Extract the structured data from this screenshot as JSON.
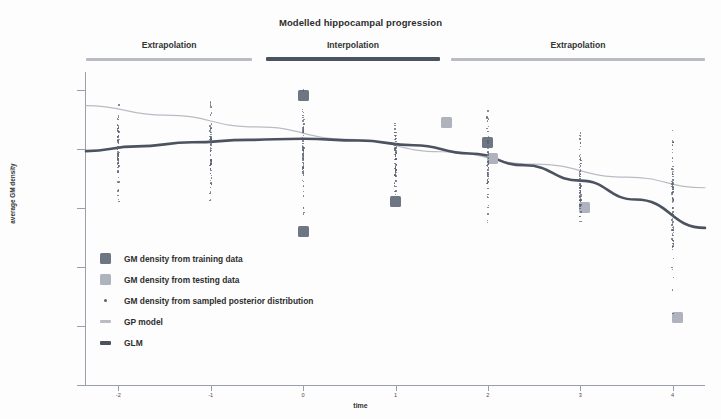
{
  "chart_data": {
    "type": "scatter",
    "title": "Modelled hippocampal progression",
    "xlabel": "time",
    "ylabel": "average GM density",
    "xlim": [
      -2.35,
      4.35
    ],
    "ylim": [
      0.95,
      0.9765
    ],
    "grid": false,
    "legend_position": "inner-lower-left",
    "x_ticks": [
      "-2",
      "-1",
      "0",
      "1",
      "2",
      "3",
      "4"
    ],
    "x_tick_values": [
      -2,
      -1,
      0,
      1,
      2,
      3,
      4
    ],
    "y_ticks": [
      "0.975",
      "0.97",
      "0.965",
      "0.96",
      "0.955",
      "0.95"
    ],
    "y_tick_values": [
      0.975,
      0.97,
      0.965,
      0.96,
      0.955,
      0.95
    ],
    "phase_bands": [
      {
        "label": "Extrapolation",
        "style": "light",
        "x_start": -2.35,
        "x_end": -0.55
      },
      {
        "label": "Interpolation",
        "style": "dark",
        "x_start": -0.4,
        "x_end": 1.48
      },
      {
        "label": "Extrapolation",
        "style": "light",
        "x_start": 1.6,
        "x_end": 4.35
      }
    ],
    "series": [
      {
        "name": "GM density from training data",
        "type": "scatter",
        "marker": "square",
        "color": "#6f7683",
        "points": [
          {
            "x": 0.0,
            "y": 0.9745
          },
          {
            "x": 0.0,
            "y": 0.963
          },
          {
            "x": 1.0,
            "y": 0.9655
          },
          {
            "x": 2.0,
            "y": 0.9705
          }
        ]
      },
      {
        "name": "GM density from testing data",
        "type": "scatter",
        "marker": "square",
        "color": "#aeb3bd",
        "points": [
          {
            "x": 1.55,
            "y": 0.9722
          },
          {
            "x": 2.05,
            "y": 0.9692
          },
          {
            "x": 3.05,
            "y": 0.965
          },
          {
            "x": 4.05,
            "y": 0.9557
          }
        ]
      },
      {
        "name": "GM density from sampled posterior distribution",
        "type": "scatter",
        "marker": "dot",
        "color": "#5a6070",
        "columns": [
          {
            "x": -2.0,
            "y_center": 0.97,
            "y_low": 0.9623,
            "y_high": 0.9748,
            "n": 46
          },
          {
            "x": -1.0,
            "y_center": 0.97,
            "y_low": 0.9636,
            "y_high": 0.9745,
            "n": 44
          },
          {
            "x": 0.0,
            "y_center": 0.9699,
            "y_low": 0.9628,
            "y_high": 0.9752,
            "n": 48
          },
          {
            "x": 1.0,
            "y_center": 0.9695,
            "y_low": 0.9634,
            "y_high": 0.9747,
            "n": 46
          },
          {
            "x": 2.0,
            "y_center": 0.9688,
            "y_low": 0.963,
            "y_high": 0.9744,
            "n": 46
          },
          {
            "x": 3.0,
            "y_center": 0.9672,
            "y_low": 0.9606,
            "y_high": 0.9736,
            "n": 48
          },
          {
            "x": 4.0,
            "y_center": 0.9652,
            "y_low": 0.9556,
            "y_high": 0.9742,
            "n": 54
          }
        ]
      },
      {
        "name": "GP model",
        "type": "line",
        "color": "#b9bcc4",
        "linewidth": 1.2,
        "points": [
          {
            "x": -2.35,
            "y": 0.97365
          },
          {
            "x": -1.5,
            "y": 0.97285
          },
          {
            "x": -0.5,
            "y": 0.97185
          },
          {
            "x": 0.5,
            "y": 0.9708
          },
          {
            "x": 1.5,
            "y": 0.96975
          },
          {
            "x": 2.5,
            "y": 0.9687
          },
          {
            "x": 3.5,
            "y": 0.9676
          },
          {
            "x": 4.35,
            "y": 0.9667
          }
        ]
      },
      {
        "name": "GLM",
        "type": "line",
        "color": "#4c5360",
        "linewidth": 2.6,
        "points": [
          {
            "x": -2.35,
            "y": 0.9698
          },
          {
            "x": -1.8,
            "y": 0.9702
          },
          {
            "x": -1.2,
            "y": 0.97055
          },
          {
            "x": -0.6,
            "y": 0.97075
          },
          {
            "x": 0.0,
            "y": 0.97085
          },
          {
            "x": 0.6,
            "y": 0.9707
          },
          {
            "x": 1.2,
            "y": 0.9703
          },
          {
            "x": 1.8,
            "y": 0.9696
          },
          {
            "x": 2.4,
            "y": 0.9686
          },
          {
            "x": 3.0,
            "y": 0.9673
          },
          {
            "x": 3.6,
            "y": 0.9657
          },
          {
            "x": 4.35,
            "y": 0.9633
          }
        ]
      }
    ]
  },
  "legend": {
    "items": [
      {
        "label": "GM density from training data",
        "swatch": "train"
      },
      {
        "label": "GM density from testing data",
        "swatch": "test"
      },
      {
        "label": "GM density from sampled posterior distribution",
        "swatch": "dot"
      },
      {
        "label": "GP model",
        "swatch": "line-gp"
      },
      {
        "label": "GLM",
        "swatch": "line-glm"
      }
    ]
  }
}
